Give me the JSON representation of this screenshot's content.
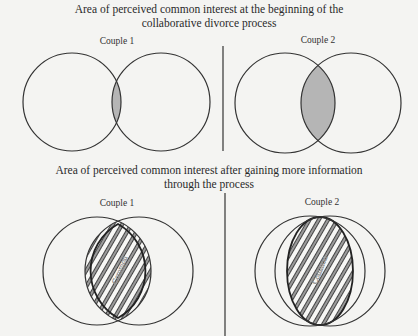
{
  "sections": [
    {
      "title_line1": "Area of perceived common interest at the beginning of the",
      "title_line2": "collaborative divorce process",
      "couples": [
        {
          "label": "Couple 1",
          "overlap": "small",
          "lens_label": ""
        },
        {
          "label": "Couple 2",
          "overlap": "medium",
          "lens_label": ""
        }
      ]
    },
    {
      "title_line1": "Area of perceived common interest after gaining more information",
      "title_line2": "through the process",
      "couples": [
        {
          "label": "Couple 1",
          "overlap": "large",
          "lens_label": "Common"
        },
        {
          "label": "Couple 2",
          "overlap": "very large",
          "lens_label": "Common"
        }
      ]
    }
  ],
  "colors": {
    "background": "#f4f4f2",
    "outline": "#333333",
    "shaded_fill": "#b5b5b5",
    "hatch_stripe": "#8a8a8a"
  }
}
